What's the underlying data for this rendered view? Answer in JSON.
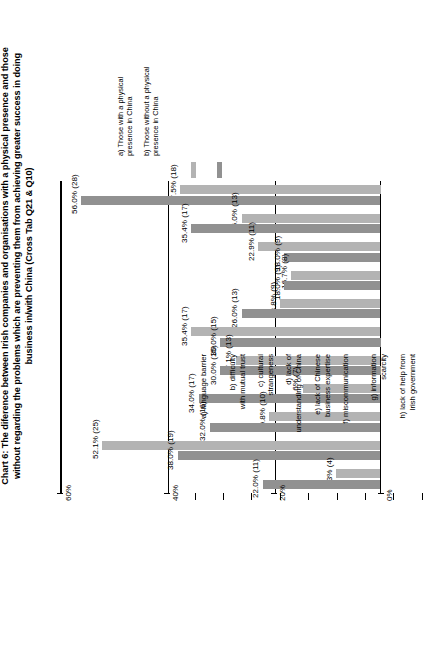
{
  "chart_data": {
    "type": "bar",
    "title": "Chart 6: The diference between Irish companies and organisations with a physical presence and those without regarding the problems which are preventing them from achieving greater success in doing business in/with China (Cross Tab Q21 & Q10)",
    "orientation": "vertical",
    "xlabel": "",
    "ylabel": "",
    "ylim": [
      0,
      60
    ],
    "yticks": [
      "0%",
      "20%",
      "40%",
      "60%"
    ],
    "grid": true,
    "legend_position": "top-right",
    "categories": [
      "a) language barrier",
      "b) difficulty\nwith mutual trust",
      "c) cultural\nstrangeness",
      "d) lack of\nunderstanding of China",
      "e) lack of Chinese\nbusiness expertise",
      "f) miscommunication",
      "g) information\nscarcity",
      "h) lack of help from\nIrish government",
      "i) lack of personal\nrelationships",
      "j) Chinese\nregulations",
      "k) lack of knowledge of\nChinese business culture"
    ],
    "series": [
      {
        "name": "a) Those with a physical presence in China",
        "color": "#b3b3b3",
        "values": [
          37.5,
          26.0,
          22.9,
          16.7,
          18.8,
          35.4,
          27.1,
          14.6,
          20.8,
          52.1,
          8.3
        ],
        "labels": [
          "37.5% (18)",
          "26.0% (13)",
          "22.9% (11)",
          "16.7% (8)",
          "18.8% (9)",
          "35.4% (17)",
          "27.1% (13)",
          "14.6% (7)",
          "20.8% (10)",
          "52.1% (25)",
          "8.3% (4)"
        ],
        "counts": [
          18,
          13,
          11,
          8,
          9,
          17,
          13,
          7,
          10,
          25,
          4
        ]
      },
      {
        "name": "b) Those without a physical presence in China",
        "color": "#919191",
        "values": [
          56.0,
          35.4,
          18.0,
          18.0,
          26.0,
          30.0,
          30.0,
          34.0,
          32.0,
          38.0,
          22.0
        ],
        "labels": [
          "56.0% (28)",
          "35.4% (17)",
          "18.0% (9)",
          "18.0% (9)",
          "26.0% (13)",
          "30.0% (15)",
          "30.0% (15)",
          "34.0% (17)",
          "32.0% (16)",
          "38.0% (19)",
          "22.0% (11)"
        ],
        "counts": [
          28,
          17,
          9,
          9,
          13,
          15,
          15,
          17,
          16,
          19,
          11
        ]
      }
    ]
  },
  "legend": {
    "entries": [
      {
        "label": "a) Those with a physical\npresence in China",
        "color": "#b3b3b3"
      },
      {
        "label": "b) Those without a physical\npresence in China",
        "color": "#919191"
      }
    ]
  },
  "axis": {
    "ticks": [
      "0%",
      "20%",
      "40%",
      "60%"
    ]
  }
}
